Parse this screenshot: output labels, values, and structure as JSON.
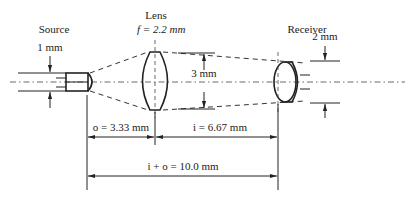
{
  "diagram": {
    "labels": {
      "source": "Source",
      "lens": "Lens",
      "lens_focal": "f = 2.2 mm",
      "receiver": "Receiver",
      "source_size": "1 mm",
      "lens_aperture": "3 mm",
      "receiver_size": "2 mm",
      "object_distance": "o = 3.33 mm",
      "image_distance": "i = 6.67 mm",
      "total_distance": "i + o = 10.0 mm"
    },
    "values": {
      "focal_length_mm": 2.2,
      "object_distance_mm": 3.33,
      "image_distance_mm": 6.67,
      "total_distance_mm": 10.0,
      "source_size_mm": 1,
      "lens_aperture_mm": 3,
      "receiver_size_mm": 2
    }
  }
}
